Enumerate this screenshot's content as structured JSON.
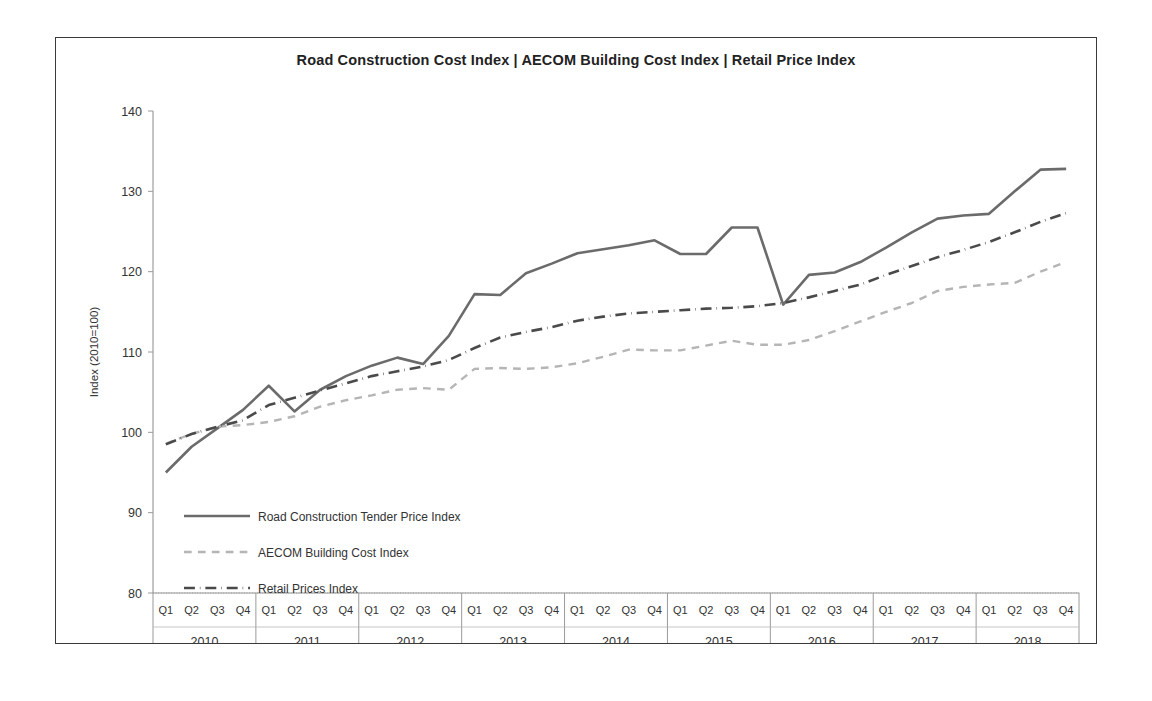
{
  "chart_data": {
    "type": "line",
    "title": "Road Construction  Cost  Index | AECOM  Building Cost  Index | Retail Price Index",
    "xlabel": "Year",
    "ylabel": "Index (2010=100)",
    "ylim": [
      80,
      140
    ],
    "yticks": [
      80,
      90,
      100,
      110,
      120,
      130,
      140
    ],
    "grid": false,
    "legend_position": "inside-lower-left",
    "years": [
      "2010",
      "2011",
      "2012",
      "2013",
      "2014",
      "2015",
      "2016",
      "2017",
      "2018"
    ],
    "quarters": [
      "Q1",
      "Q2",
      "Q3",
      "Q4"
    ],
    "categories": [
      "2010 Q1",
      "2010 Q2",
      "2010 Q3",
      "2010 Q4",
      "2011 Q1",
      "2011 Q2",
      "2011 Q3",
      "2011 Q4",
      "2012 Q1",
      "2012 Q2",
      "2012 Q3",
      "2012 Q4",
      "2013 Q1",
      "2013 Q2",
      "2013 Q3",
      "2013 Q4",
      "2014 Q1",
      "2014 Q2",
      "2014 Q3",
      "2014 Q4",
      "2015 Q1",
      "2015 Q2",
      "2015 Q3",
      "2015 Q4",
      "2016 Q1",
      "2016 Q2",
      "2016 Q3",
      "2016 Q4",
      "2017 Q1",
      "2017 Q2",
      "2017 Q3",
      "2017 Q4",
      "2018 Q1",
      "2018 Q2",
      "2018 Q3",
      "2018 Q4"
    ],
    "series": [
      {
        "name": "Road Construction Tender Price Index",
        "style": "solid",
        "color": "#6b6b6b",
        "width": 2.6,
        "values": [
          95.0,
          98.2,
          100.5,
          102.8,
          105.8,
          102.6,
          105.3,
          107.0,
          108.3,
          109.3,
          108.5,
          112.0,
          117.2,
          117.1,
          119.8,
          121.0,
          122.3,
          122.8,
          123.3,
          123.9,
          122.2,
          122.2,
          125.5,
          125.5,
          115.9,
          119.6,
          119.9,
          121.2,
          123.0,
          124.9,
          126.6,
          127.0,
          127.2,
          130.0,
          132.7,
          132.8
        ]
      },
      {
        "name": "AECOM Building Cost Index",
        "style": "dashed",
        "color": "#b5b5b5",
        "width": 2.4,
        "values": [
          98.6,
          99.8,
          100.7,
          100.9,
          101.3,
          102.0,
          103.2,
          104.0,
          104.6,
          105.3,
          105.5,
          105.3,
          107.9,
          108.0,
          107.9,
          108.1,
          108.6,
          109.4,
          110.3,
          110.2,
          110.2,
          110.8,
          111.4,
          110.9,
          110.9,
          111.5,
          112.6,
          113.8,
          115.0,
          116.1,
          117.6,
          118.1,
          118.4,
          118.6,
          120.0,
          121.2
        ]
      },
      {
        "name": "Retail Prices Index",
        "style": "dashdot",
        "color": "#4a4a4a",
        "width": 2.6,
        "values": [
          98.5,
          99.8,
          100.7,
          101.5,
          103.4,
          104.3,
          105.2,
          106.1,
          107.0,
          107.6,
          108.2,
          109.0,
          110.5,
          111.8,
          112.5,
          113.1,
          113.9,
          114.4,
          114.8,
          115.0,
          115.2,
          115.4,
          115.5,
          115.7,
          116.1,
          116.8,
          117.6,
          118.4,
          119.6,
          120.7,
          121.8,
          122.7,
          123.7,
          124.9,
          126.2,
          127.3
        ]
      }
    ]
  },
  "legend": {
    "items": [
      {
        "label": "Road Construction Tender Price Index",
        "style": "solid",
        "color": "#6b6b6b"
      },
      {
        "label": "AECOM Building Cost Index",
        "style": "dashed",
        "color": "#b5b5b5"
      },
      {
        "label": "Retail Prices Index",
        "style": "dashdot",
        "color": "#4a4a4a"
      }
    ]
  }
}
